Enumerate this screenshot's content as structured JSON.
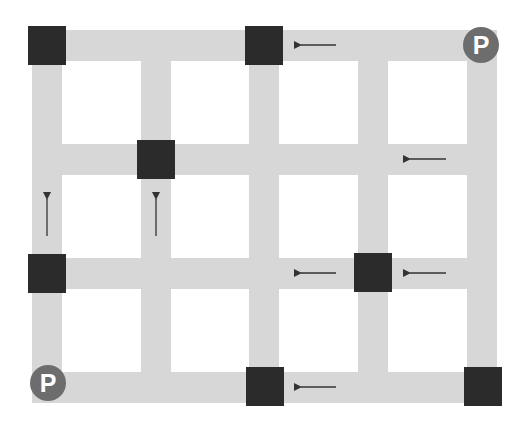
{
  "diagram": {
    "type": "road-grid",
    "colors": {
      "road": "#d7d7d7",
      "node": "#2b2b2b",
      "parking": "#6d6d6d",
      "parking_text": "#ffffff",
      "arrow": "#333333",
      "background": "#ffffff"
    },
    "vertical_roads_x": [
      47,
      156,
      264,
      373,
      482
    ],
    "horizontal_roads_y": [
      45,
      159,
      273,
      387
    ],
    "nodes": [
      {
        "id": "node-1",
        "col": 0,
        "row": 0
      },
      {
        "id": "node-2",
        "col": 2,
        "row": 0
      },
      {
        "id": "node-3",
        "col": 1,
        "row": 1
      },
      {
        "id": "node-4",
        "col": 0,
        "row": 2
      },
      {
        "id": "node-5",
        "col": 3,
        "row": 2
      },
      {
        "id": "node-6",
        "col": 2,
        "row": 3
      },
      {
        "id": "node-7",
        "col": 4,
        "row": 3
      }
    ],
    "parking": [
      {
        "id": "parking-top-right",
        "label": "P",
        "col": 4,
        "row": 0
      },
      {
        "id": "parking-bottom-left",
        "label": "P",
        "col": 0,
        "row": 3
      }
    ],
    "arrows": [
      {
        "id": "arrow-1",
        "direction": "left",
        "between": "row 0, col 2-3"
      },
      {
        "id": "arrow-2",
        "direction": "left",
        "between": "row 1, col 3-4"
      },
      {
        "id": "arrow-3",
        "direction": "up",
        "between": "col 0, row 1-2"
      },
      {
        "id": "arrow-4",
        "direction": "up",
        "between": "col 1, row 1-2"
      },
      {
        "id": "arrow-5",
        "direction": "left",
        "between": "row 2, col 2-3"
      },
      {
        "id": "arrow-6",
        "direction": "left",
        "between": "row 2, col 3-4"
      },
      {
        "id": "arrow-7",
        "direction": "left",
        "between": "row 3, col 2-3"
      }
    ]
  },
  "labels": {
    "parking_top_right": "P",
    "parking_bottom_left": "P"
  }
}
